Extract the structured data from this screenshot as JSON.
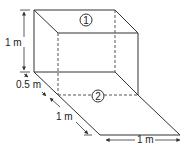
{
  "diagram": {
    "type": "isometric tank with inclined plane",
    "labels": {
      "height": "1 m",
      "offset": "0.5 m",
      "slope_length": "1 m",
      "width": "1 m"
    },
    "regions": {
      "region_1": "1",
      "region_2": "2"
    },
    "colors": {
      "line": "#333333",
      "background": "#ffffff"
    }
  }
}
